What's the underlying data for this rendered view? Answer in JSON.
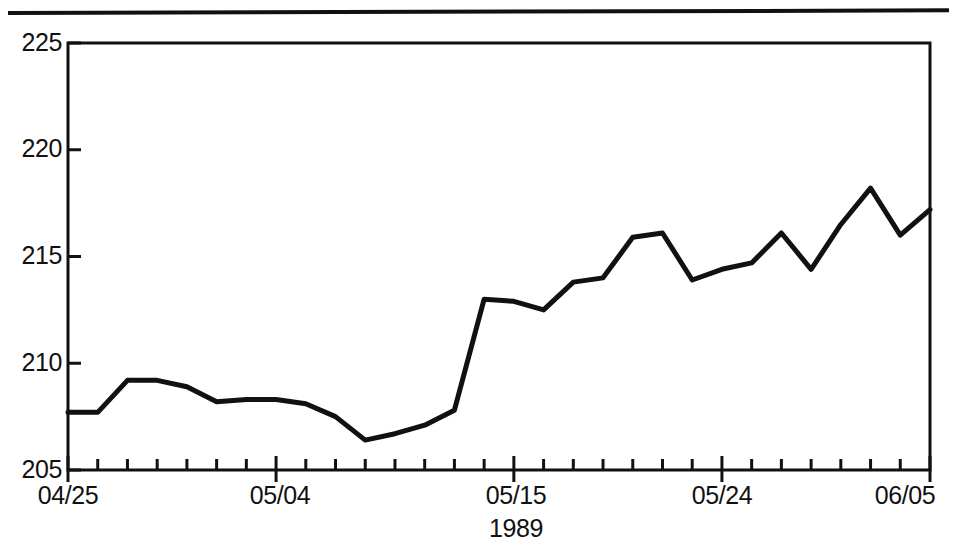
{
  "figure": {
    "top_rule_name": "page-divider-rule"
  },
  "chart_data": {
    "type": "line",
    "title": "",
    "subtitle": "",
    "xlabel": "1989",
    "ylabel": "",
    "ylim": [
      205,
      225
    ],
    "y_ticks": [
      205,
      210,
      215,
      220,
      225
    ],
    "y_tick_labels": [
      "205",
      "210",
      "215",
      "220",
      "225"
    ],
    "grid": false,
    "legend": null,
    "x_axis_title": "1989",
    "x_tick_labels": [
      "04/25",
      "05/04",
      "05/15",
      "05/24",
      "06/05"
    ],
    "x_major_tick_indices": [
      0,
      7,
      15,
      22,
      29
    ],
    "x_minor_tick_count": 30,
    "line_color": "#111111",
    "line_width": 5,
    "x": [
      "04/25",
      "04/26",
      "04/27",
      "04/28",
      "05/01",
      "05/02",
      "05/03",
      "05/04",
      "05/05",
      "05/08",
      "05/09",
      "05/10",
      "05/11",
      "05/12",
      "05/15",
      "05/16",
      "05/17",
      "05/18",
      "05/19",
      "05/22",
      "05/23",
      "05/24",
      "05/25",
      "05/26",
      "05/30",
      "05/31",
      "06/01",
      "06/02",
      "06/05",
      "06/06"
    ],
    "values": [
      207.7,
      207.7,
      209.2,
      209.2,
      208.9,
      208.2,
      208.3,
      208.3,
      208.1,
      207.5,
      206.4,
      206.7,
      207.1,
      207.8,
      213.0,
      212.9,
      212.5,
      213.8,
      214.0,
      215.9,
      216.1,
      213.9,
      214.4,
      214.7,
      216.1,
      214.4,
      216.5,
      218.2,
      216.0,
      217.2
    ],
    "series": [
      {
        "name": "value",
        "values": [
          207.7,
          207.7,
          209.2,
          209.2,
          208.9,
          208.2,
          208.3,
          208.3,
          208.1,
          207.5,
          206.4,
          206.7,
          207.1,
          207.8,
          213.0,
          212.9,
          212.5,
          213.8,
          214.0,
          215.9,
          216.1,
          213.9,
          214.4,
          214.7,
          216.1,
          214.4,
          216.5,
          218.2,
          216.0,
          217.2
        ]
      }
    ],
    "annotations": []
  }
}
